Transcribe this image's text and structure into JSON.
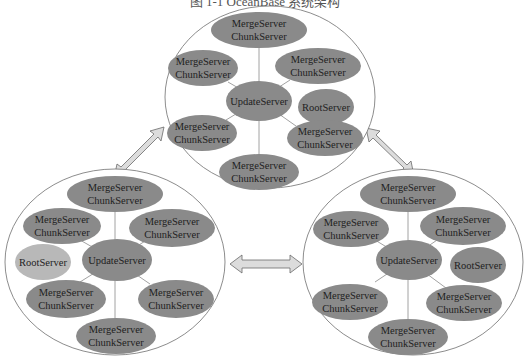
{
  "caption": "图 1-1  OceanBase 系统架构",
  "colors": {
    "node_fill": "#8a8a8a",
    "root_fill_light": "#b8b8b8",
    "cluster_stroke": "#6f6f6f",
    "arrow_fill": "#dcdcdc",
    "arrow_stroke": "#6a6a6a",
    "edge": "#8a8a8a"
  },
  "clusters": [
    {
      "name": "top",
      "center_label": "UpdateServer",
      "root_label": "RootServer",
      "node_label_line1": "MergeServer",
      "node_label_line2": "ChunkServer"
    },
    {
      "name": "left",
      "center_label": "UpdateServer",
      "root_label": "RootServer",
      "node_label_line1": "MergeServer",
      "node_label_line2": "ChunkServer"
    },
    {
      "name": "right",
      "center_label": "UpdateServer",
      "root_label": "RootServer",
      "node_label_line1": "MergeServer",
      "node_label_line2": "ChunkServer"
    }
  ]
}
